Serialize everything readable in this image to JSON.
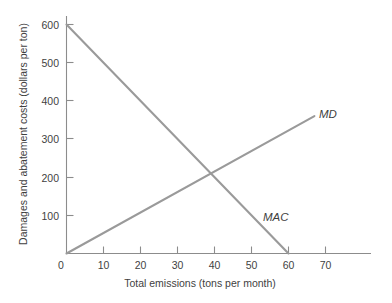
{
  "chart_data": {
    "type": "line",
    "title": "",
    "xlabel": "Total emissions (tons per month)",
    "ylabel": "Damages and abatement costs (dollars per ton)",
    "xlim": [
      0,
      80
    ],
    "ylim": [
      0,
      620
    ],
    "grid": false,
    "legend_position": "inline-end-of-line",
    "xticks": [
      0,
      10,
      20,
      30,
      40,
      50,
      60,
      70
    ],
    "xtick_labels": [
      "0",
      "10",
      "20",
      "30",
      "40",
      "50",
      "60",
      "70"
    ],
    "yticks": [
      100,
      200,
      300,
      400,
      500,
      600
    ],
    "ytick_labels": [
      "100",
      "200",
      "300",
      "400",
      "500",
      "600"
    ],
    "line_color": "#9a9a9a",
    "axis_color": "#8c8c8c",
    "text_color": "#3f3f3f",
    "background": "#ffffff",
    "series": [
      {
        "name": "MAC",
        "label": "MAC",
        "description": "Marginal abatement cost, downward sloping",
        "x": [
          0,
          60
        ],
        "values": [
          600,
          0
        ],
        "label_x": 58,
        "label_y": 105
      },
      {
        "name": "MD",
        "label": "MD",
        "description": "Marginal damage, upward sloping",
        "x": [
          0,
          67
        ],
        "values": [
          0,
          360
        ],
        "label_x": 69.5,
        "label_y": 378
      }
    ],
    "annotations": [
      {
        "name": "efficient-equilibrium",
        "x": 40,
        "y": 200,
        "text": ""
      }
    ]
  },
  "axes": {
    "y_title": "Damages and abatement costs (dollars per ton)",
    "x_title": "Total emissions (tons per month)"
  },
  "labels": {
    "md": "MD",
    "mac": "MAC",
    "y0": "0",
    "y100": "100",
    "y200": "200",
    "y300": "300",
    "y400": "400",
    "y500": "500",
    "y600": "600",
    "x0": "0",
    "x10": "10",
    "x20": "20",
    "x30": "30",
    "x40": "40",
    "x50": "50",
    "x60": "60",
    "x70": "70"
  }
}
